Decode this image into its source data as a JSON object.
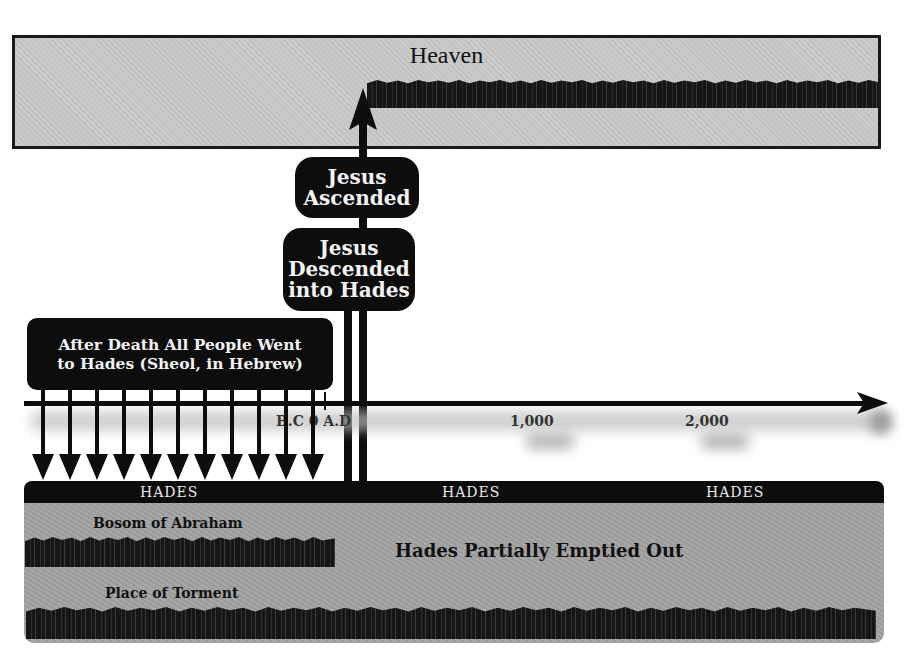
{
  "heaven": {
    "title": "Heaven"
  },
  "boxes": {
    "ascended": "Jesus\nAscended",
    "ascended_line1": "Jesus",
    "ascended_line2": "Ascended",
    "descended_line1": "Jesus",
    "descended_line2": "Descended",
    "descended_line3": "into Hades",
    "after_death_line1": "After Death All People Went",
    "after_death_line2": "to Hades (Sheol, in Hebrew)"
  },
  "timeline": {
    "labels": [
      "B.C 0 A.D",
      "1,000",
      "2,000"
    ],
    "bc_ad": "B.C 0 A.D",
    "tick_1000": "1,000",
    "tick_2000": "2,000"
  },
  "hades": {
    "bar_labels": [
      "HADES",
      "HADES",
      "HADES"
    ],
    "bosom": "Bosom of Abraham",
    "torment": "Place of Torment",
    "partially_emptied": "Hades Partially Emptied Out"
  },
  "colors": {
    "heaven_fill": "#c9c9c9",
    "hades_fill": "#a3a3a3",
    "dark": "#0d0d0d",
    "text_light": "#f2f2f2"
  }
}
